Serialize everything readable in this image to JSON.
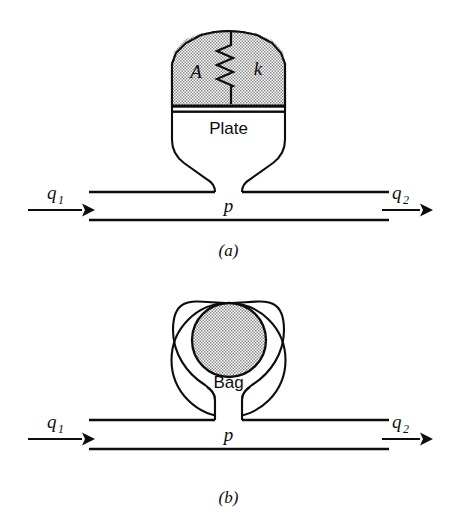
{
  "figure": {
    "background_color": "#ffffff",
    "ink_color": "#0d0d0d",
    "stipple_color": "#9a9a9a",
    "panels": [
      {
        "id": "panel-a",
        "caption": "(a)",
        "accumulator_type": "spring-loaded-plate",
        "labels": {
          "area": "A",
          "spring_constant": "k",
          "plate": "Plate",
          "pressure": "p",
          "inflow": "q",
          "inflow_subscript": "1",
          "outflow": "q",
          "outflow_subscript": "2"
        }
      },
      {
        "id": "panel-b",
        "caption": "(b)",
        "accumulator_type": "gas-bag",
        "labels": {
          "bag": "Bag",
          "pressure": "p",
          "inflow": "q",
          "inflow_subscript": "1",
          "outflow": "q",
          "outflow_subscript": "2"
        }
      }
    ]
  }
}
